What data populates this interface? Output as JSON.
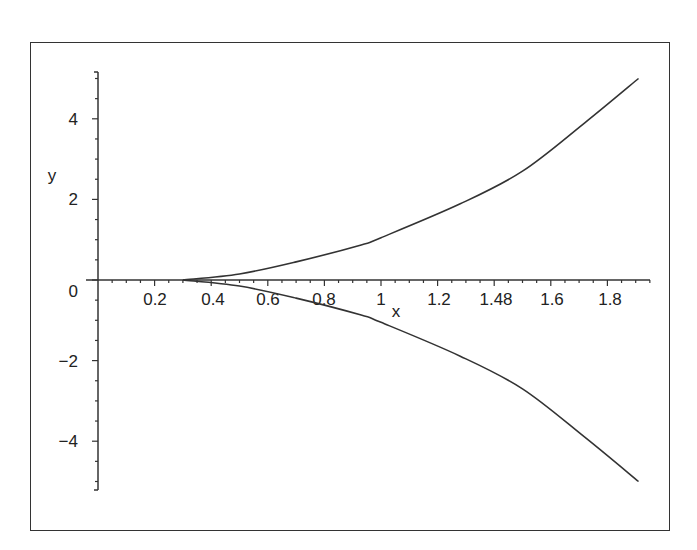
{
  "chart_data": {
    "type": "line",
    "title": "",
    "xlabel": "x",
    "ylabel": "y",
    "xlim": [
      0,
      1.95
    ],
    "ylim": [
      -5.2,
      5.2
    ],
    "grid": false,
    "legend": null,
    "x_tick_labels": [
      "0.2",
      "0.4",
      "0.6",
      "0.8",
      "1",
      "1.2",
      "1.48",
      "1.6",
      "1.8"
    ],
    "y_tick_labels": [
      "4",
      "2",
      "0",
      "−2",
      "−4"
    ],
    "series": [
      {
        "name": "upper branch",
        "x": [
          0.3,
          0.5,
          0.7,
          0.93,
          1.0,
          1.28,
          1.5,
          1.72,
          1.91
        ],
        "values": [
          0,
          0.15,
          0.45,
          0.87,
          1.05,
          1.89,
          2.7,
          3.9,
          5.0
        ]
      },
      {
        "name": "lower branch",
        "x": [
          0.3,
          0.5,
          0.7,
          0.93,
          1.0,
          1.28,
          1.5,
          1.72,
          1.91
        ],
        "values": [
          0,
          -0.15,
          -0.45,
          -0.87,
          -1.05,
          -1.89,
          -2.7,
          -3.9,
          -5.0
        ]
      }
    ]
  },
  "axes": {
    "x_label": "x",
    "y_label": "y",
    "x_ticks": [
      "0.2",
      "0.4",
      "0.6",
      "0.8",
      "1",
      "1.2",
      "1.48",
      "1.6",
      "1.8"
    ],
    "y_ticks": [
      "4",
      "2",
      "0",
      "−2",
      "−4"
    ]
  }
}
